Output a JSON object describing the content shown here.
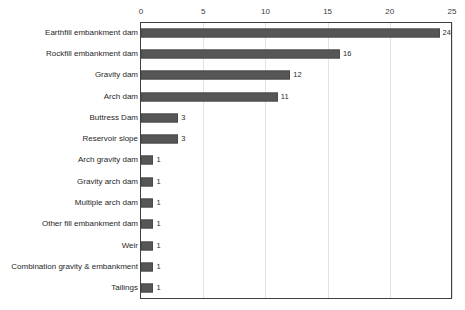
{
  "chart_data": {
    "type": "bar",
    "orientation": "horizontal",
    "title": "",
    "subtitle": "",
    "xlabel": "",
    "ylabel": "",
    "xlim": [
      0,
      25
    ],
    "ylim": null,
    "grid": true,
    "legend": null,
    "legend_position": "none",
    "xticks": [
      "0",
      "5",
      "10",
      "15",
      "20",
      "25"
    ],
    "xtick_values": [
      0,
      5,
      10,
      15,
      20,
      25
    ],
    "categories": [
      "Earthfill embankment dam",
      "Rockfill embankment dam",
      "Gravity dam",
      "Arch dam",
      "Buttress Dam",
      "Reservoir slope",
      "Arch gravity dam",
      "Gravity arch dam",
      "Multiple arch dam",
      "Other fill embankment dam",
      "Weir",
      "Combination gravity & embankment",
      "Tailings"
    ],
    "values": [
      24,
      16,
      12,
      11,
      3,
      3,
      1,
      1,
      1,
      1,
      1,
      1,
      1
    ],
    "data_labels": [
      "24",
      "16",
      "12",
      "11",
      "3",
      "3",
      "1",
      "1",
      "1",
      "1",
      "1",
      "1",
      "1"
    ],
    "series": [
      {
        "name": "Count",
        "values": [
          24,
          16,
          12,
          11,
          3,
          3,
          1,
          1,
          1,
          1,
          1,
          1,
          1
        ]
      }
    ]
  },
  "colors": {
    "bar_fill": "#565656",
    "bar_stroke": "#4a4a4a",
    "plot_border": "#3f3f3f",
    "gridline": "#e2e2e2",
    "background": "#ffffff",
    "label_text": "#1f1f1f",
    "tick_text": "#3a3a3a",
    "value_text": "#2b2b2b"
  }
}
